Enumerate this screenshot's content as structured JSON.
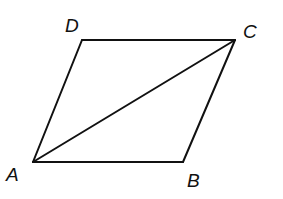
{
  "figure": {
    "type": "parallelogram",
    "vertices": [
      {
        "name": "A",
        "x": 33,
        "y": 162,
        "label_x": 6,
        "label_y": 181
      },
      {
        "name": "B",
        "x": 183,
        "y": 162,
        "label_x": 187,
        "label_y": 187
      },
      {
        "name": "C",
        "x": 235,
        "y": 40,
        "label_x": 243,
        "label_y": 38
      },
      {
        "name": "D",
        "x": 82,
        "y": 40,
        "label_x": 65,
        "label_y": 32
      }
    ],
    "edges": [
      {
        "from": "A",
        "to": "B"
      },
      {
        "from": "B",
        "to": "C"
      },
      {
        "from": "C",
        "to": "D"
      },
      {
        "from": "D",
        "to": "A"
      }
    ],
    "diagonals": [
      {
        "from": "A",
        "to": "C"
      }
    ],
    "stroke_color": "#111111",
    "background_color": "#ffffff"
  }
}
